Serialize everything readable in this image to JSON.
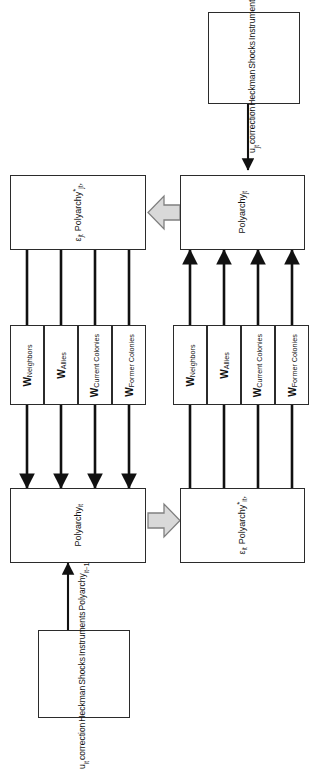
{
  "diagram": {
    "orientation": "rotated-90-ccw",
    "colors": {
      "stroke": "#2b2b2b",
      "block_arrow_fill": "#d9d9d9",
      "block_arrow_stroke": "#808080",
      "text": "#111111",
      "background": "#ffffff"
    },
    "boxes": {
      "instruments_j": {
        "lines": [
          "Polyarchyⱼₜ₋₁",
          "Instruments",
          "Shocks",
          "Heckman",
          "correction",
          "uⱼₜ"
        ],
        "line1_base": "Polyarchy",
        "line1_sub": "jt−1",
        "line2": "Instruments",
        "line3": "Shocks",
        "line4": "Heckman",
        "line5": "correction",
        "line6_base": "u",
        "line6_sub": "jt"
      },
      "instruments_i": {
        "line1_base": "Polyarchy",
        "line1_sub": "it−1",
        "line2": "Instruments",
        "line3": "Shocks",
        "line4": "Heckman",
        "line5": "correction",
        "line6_base": "u",
        "line6_sub": "it"
      },
      "polyarchy_jt": {
        "base": "Polyarchy",
        "sub": "jt"
      },
      "polyarchy_it": {
        "base": "Polyarchy",
        "sub": "it"
      },
      "polyarchy_star_jt": {
        "base": "Polyarchy",
        "star": "*",
        "sub": "jt",
        "comma": ",",
        "error_base": "ε",
        "error_sub": "jt"
      },
      "polyarchy_star_it": {
        "base": "Polyarchy",
        "star": "*",
        "sub": "it",
        "comma": ",",
        "error_base": "ε",
        "error_sub": "it"
      }
    },
    "weight_matrices_left": [
      {
        "symbol": "W",
        "sub": "Neighbors"
      },
      {
        "symbol": "W",
        "sub": "Allies"
      },
      {
        "symbol": "W",
        "sub": "Current Colonies"
      },
      {
        "symbol": "W",
        "sub": "Former Colonies"
      }
    ],
    "weight_matrices_right": [
      {
        "symbol": "W",
        "sub": "Neighbors"
      },
      {
        "symbol": "W",
        "sub": "Allies"
      },
      {
        "symbol": "W",
        "sub": "Current Colonies"
      },
      {
        "symbol": "W",
        "sub": "Former Colonies"
      }
    ],
    "connectors": {
      "instruments_j_to_polyarchy_jt": "arrow-down",
      "instruments_i_to_polyarchy_it": "arrow-up",
      "polyarchy_jt_to_star_jt": "block-arrow-left",
      "polyarchy_it_to_star_it": "block-arrow-right",
      "star_jt_to_weights_left": "four-arrows-down",
      "weights_left_to_polyarchy_it": "four-arrows-down",
      "star_it_to_weights_right": "four-arrows-up",
      "weights_right_to_polyarchy_jt": "four-arrows-up"
    }
  }
}
